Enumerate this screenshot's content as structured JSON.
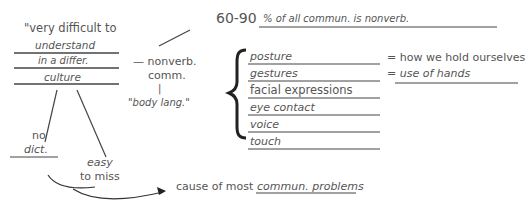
{
  "notes": {
    "left_block": {
      "lines": [
        "\"very difficult to",
        "understand",
        "in a differ.",
        "culture"
      ]
    },
    "nonverbal": {
      "label_line1": "— nonverb.",
      "label_line2": "comm.",
      "connector": "|",
      "alias": "\"body lang.\""
    },
    "stat": {
      "value": "60-90",
      "description": "% of all commun. is nonverb."
    },
    "list": {
      "items": [
        {
          "label": "posture",
          "definition": "= how we hold ourselves"
        },
        {
          "label": "gestures",
          "definition": "= use of hands"
        },
        {
          "label": "facial expressions",
          "definition": ""
        },
        {
          "label": "eye contact",
          "definition": ""
        },
        {
          "label": "voice",
          "definition": ""
        },
        {
          "label": "touch",
          "definition": ""
        }
      ]
    },
    "branches": {
      "left": {
        "line1": "no",
        "line2": "dict."
      },
      "right": {
        "line1": "easy",
        "line2": "to miss"
      }
    },
    "conclusion": {
      "prefix": "cause of most",
      "emphasis": "commun. problems"
    }
  },
  "colors": {
    "ink": "#555555",
    "line": "#444444",
    "background": "#ffffff"
  }
}
